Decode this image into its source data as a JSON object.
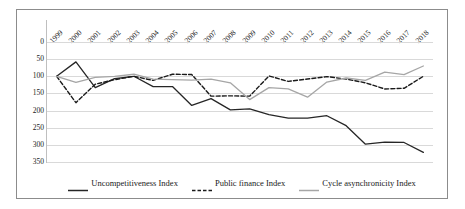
{
  "chart_data": {
    "type": "line",
    "title": "",
    "xlabel": "",
    "ylabel": "",
    "grid": true,
    "legend_position": "bottom",
    "y_axis_inverted": true,
    "ylim": [
      0,
      350
    ],
    "yticks": [
      0,
      50,
      100,
      150,
      200,
      250,
      300,
      350
    ],
    "categories": [
      "1999",
      "2000",
      "2001",
      "2002",
      "2003",
      "2004",
      "2005",
      "2006",
      "2007",
      "2008",
      "2009",
      "2010",
      "2011",
      "2012",
      "2013",
      "2014",
      "2015",
      "2016",
      "2017",
      "2018"
    ],
    "series": [
      {
        "name": "Uncompetitiveness Index",
        "style": "solid",
        "color": "#262626",
        "values": [
          100,
          58,
          133,
          107,
          100,
          130,
          130,
          185,
          165,
          198,
          195,
          212,
          222,
          222,
          215,
          244,
          298,
          292,
          293,
          322
        ]
      },
      {
        "name": "Public finance Index",
        "style": "dashed",
        "color": "#1a1a1a",
        "values": [
          100,
          177,
          123,
          110,
          100,
          112,
          94,
          95,
          158,
          157,
          158,
          99,
          115,
          108,
          101,
          108,
          119,
          137,
          135,
          100
        ]
      },
      {
        "name": "Cycle asynchronicity Index",
        "style": "solid",
        "color": "#a6a6a6",
        "values": [
          100,
          118,
          103,
          100,
          94,
          108,
          110,
          111,
          108,
          119,
          168,
          133,
          137,
          161,
          117,
          105,
          112,
          88,
          95,
          70
        ]
      }
    ]
  },
  "legend": {
    "items": [
      {
        "label": "Uncompetitiveness Index",
        "swatch": "solid-line-swatch"
      },
      {
        "label": "Public finance Index",
        "swatch": "dashed-line-swatch"
      },
      {
        "label": "Cycle asynchronicity Index",
        "swatch": "gray-line-swatch"
      }
    ]
  },
  "colors": {
    "grid": "#d9d9d9",
    "border": "#8c8c8c",
    "text": "#1a1a1a",
    "background": "#ffffff"
  }
}
